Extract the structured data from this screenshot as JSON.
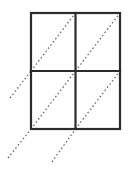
{
  "figure": {
    "canvas": {
      "width": 132,
      "height": 170,
      "background": "#ffffff"
    },
    "grid": {
      "label": "2x2 rectangle grid",
      "x0": 31,
      "y0": 13,
      "x1": 120,
      "y1": 129,
      "mid_x": 75.5,
      "mid_y": 71,
      "columns": 2,
      "rows": 2,
      "cell_width": 44.5,
      "cell_height": 58,
      "stroke_color": "#2b2b2b",
      "stroke_width": 2.2
    },
    "diagonals": {
      "label": "dotted diagonal lines at 45 degrees",
      "stroke_color": "#6e6e6e",
      "stroke_width": 1.3,
      "dash_pattern": "1.6 2.4",
      "angle_degrees": 45,
      "direction": "lower-left to upper-right",
      "segments": [
        {
          "name": "diagonal-cell-top-left",
          "x1": 31,
          "y1": 71,
          "x2": 75.5,
          "y2": 13
        },
        {
          "name": "diagonal-cell-top-right",
          "x1": 75.5,
          "y1": 71,
          "x2": 120,
          "y2": 13
        },
        {
          "name": "diagonal-cell-bottom-left",
          "x1": 31,
          "y1": 129,
          "x2": 75.5,
          "y2": 71
        },
        {
          "name": "diagonal-cell-bottom-right",
          "x1": 75.5,
          "y1": 129,
          "x2": 120,
          "y2": 71
        },
        {
          "name": "diagonal-extension-mid-left",
          "x1": 10,
          "y1": 98,
          "x2": 31,
          "y2": 71
        },
        {
          "name": "diagonal-extension-bottom-left",
          "x1": 8,
          "y1": 158,
          "x2": 31,
          "y2": 129
        },
        {
          "name": "diagonal-extension-bottom-mid",
          "x1": 52,
          "y1": 162,
          "x2": 75.5,
          "y2": 129
        }
      ]
    },
    "gridlines": [
      {
        "name": "grid-outer-border",
        "type": "rect",
        "x": 31,
        "y": 13,
        "width": 89,
        "height": 116
      },
      {
        "name": "grid-line-horizontal-middle",
        "type": "line",
        "x1": 31,
        "y1": 71,
        "x2": 120,
        "y2": 71
      },
      {
        "name": "grid-line-vertical-middle",
        "type": "line",
        "x1": 75.5,
        "y1": 13,
        "x2": 75.5,
        "y2": 129
      }
    ]
  }
}
